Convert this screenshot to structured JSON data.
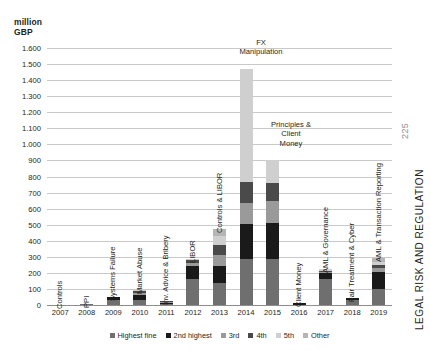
{
  "page": {
    "folio": "225",
    "running_head": "LEGAL RISK AND REGULATION"
  },
  "legend": {
    "items": [
      {
        "label": "Highest fine",
        "color": "#6f6f6f"
      },
      {
        "label": "2nd highest",
        "color": "#1a1a1a"
      },
      {
        "label": "3rd",
        "color": "#9a9a9a"
      },
      {
        "label": "4th",
        "color": "#4a4a4a"
      },
      {
        "label": "5th",
        "color": "#cfcfcf"
      },
      {
        "label": "Other",
        "color": "#b5b5b5"
      }
    ]
  },
  "callouts": [
    {
      "name": "fx-manipulation",
      "text": "FX\nManipulation",
      "left": 218,
      "top": 38,
      "width": 86
    },
    {
      "name": "principles-client-money",
      "text": "Principles &\nClient\nMoney",
      "left": 256,
      "top": 120,
      "width": 70
    }
  ],
  "chart_data": {
    "type": "bar",
    "stacked": true,
    "title": "",
    "subtitle": "",
    "xlabel": "",
    "ylabel": "million GBP",
    "ylim": [
      0,
      1600
    ],
    "ytick_step": 100,
    "grid": true,
    "legend_position": "bottom",
    "ytick_labels": [
      "1.600",
      "1.500",
      "1.400",
      "1.300",
      "1.200",
      "1.100",
      "1.000",
      "900",
      "800",
      "700",
      "600",
      "500",
      "400",
      "300",
      "200",
      "100",
      "0"
    ],
    "categories": [
      "2007",
      "2008",
      "2009",
      "2010",
      "2011",
      "2012",
      "2013",
      "2014",
      "2015",
      "2016",
      "2017",
      "2018",
      "2019"
    ],
    "series": [
      {
        "name": "Highest fine",
        "color": "#6f6f6f",
        "values": [
          0,
          7,
          33,
          33,
          8,
          160,
          137,
          284,
          285,
          0,
          163,
          32,
          102
        ]
      },
      {
        "name": "2nd highest",
        "color": "#1a1a1a",
        "values": [
          0,
          0,
          14,
          27,
          6,
          80,
          105,
          222,
          227,
          10,
          34,
          12,
          101
        ]
      },
      {
        "name": "3rd",
        "color": "#9a9a9a",
        "values": [
          0,
          0,
          0,
          14,
          5,
          21,
          69,
          129,
          134,
          0,
          10,
          0,
          30
        ]
      },
      {
        "name": "4th",
        "color": "#4a4a4a",
        "values": [
          0,
          0,
          0,
          11,
          4,
          17,
          62,
          133,
          116,
          0,
          8,
          0,
          18
        ]
      },
      {
        "name": "5th",
        "color": "#cfcfcf",
        "values": [
          0,
          0,
          0,
          6,
          3,
          10,
          54,
          703,
          140,
          0,
          7,
          0,
          20
        ]
      },
      {
        "name": "Other",
        "color": "#b5b5b5",
        "values": [
          0,
          0,
          0,
          0,
          0,
          0,
          45,
          0,
          0,
          0,
          0,
          0,
          24
        ]
      }
    ],
    "bar_annotations": [
      {
        "category": "2007",
        "label": "Controls"
      },
      {
        "category": "2008",
        "label": "PPI"
      },
      {
        "category": "2009",
        "label": "Systems Failure"
      },
      {
        "category": "2010",
        "label": "Market Abuse"
      },
      {
        "category": "2011",
        "label": "Inv. Advice & Bribery"
      },
      {
        "category": "2012",
        "label": "LIBOR"
      },
      {
        "category": "2013",
        "label": "Controls & LIBOR"
      },
      {
        "category": "2014",
        "label": ""
      },
      {
        "category": "2015",
        "label": ""
      },
      {
        "category": "2016",
        "label": "Client Money"
      },
      {
        "category": "2017",
        "label": "AML & Governance"
      },
      {
        "category": "2018",
        "label": "Fair Treatment & Cyber"
      },
      {
        "category": "2019",
        "label": "AML & Transaction Reporting"
      }
    ],
    "annotation_heights": {
      "2007": 57,
      "2008": 38,
      "2009": 82,
      "2010": 77,
      "2011": 112,
      "2012": 44,
      "2013": 97,
      "2016": 70,
      "2017": 101,
      "2018": 124,
      "2019": 157
    }
  }
}
